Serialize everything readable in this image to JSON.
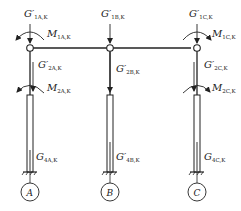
{
  "diagram": {
    "columns": [
      {
        "axis": "A",
        "top_load": {
          "symbol": "G′",
          "sub": "1A,K"
        },
        "top_moment": {
          "symbol": "M",
          "sub": "1A,K"
        },
        "mid_load": {
          "symbol": "G′",
          "sub": "2A,K"
        },
        "mid_moment": {
          "symbol": "M",
          "sub": "2A,K"
        },
        "base_load": {
          "symbol": "G",
          "sub": "4A,K"
        }
      },
      {
        "axis": "B",
        "top_load": {
          "symbol": "G′",
          "sub": "1B,K"
        },
        "mid_load": {
          "symbol": "G′",
          "sub": "2B,K"
        },
        "base_load": {
          "symbol": "G′",
          "sub": "4B,K"
        }
      },
      {
        "axis": "C",
        "top_load": {
          "symbol": "G′",
          "sub": "1C,K"
        },
        "top_moment": {
          "symbol": "M",
          "sub": "1C,K"
        },
        "mid_load": {
          "symbol": "G′",
          "sub": "2C,K"
        },
        "mid_moment": {
          "symbol": "M",
          "sub": "2C,K"
        },
        "base_load": {
          "symbol": "G",
          "sub": "4C,K"
        }
      }
    ]
  }
}
